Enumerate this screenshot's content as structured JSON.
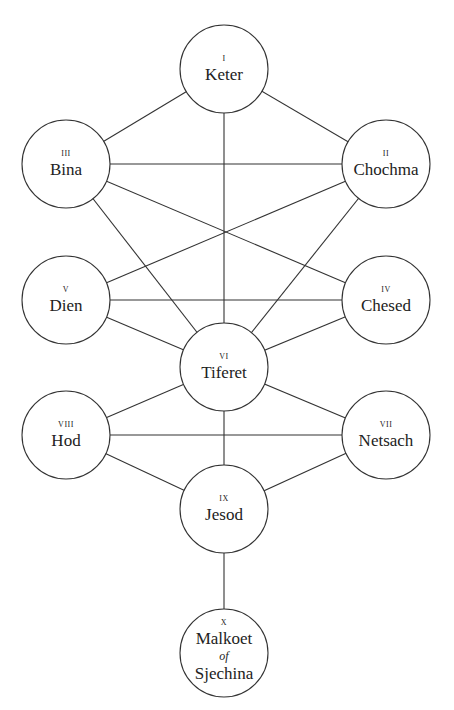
{
  "diagram": {
    "colors": {
      "line": "#333333",
      "fill": "#ffffff",
      "text": "#222222"
    },
    "radius": 44,
    "nodes": [
      {
        "id": "keter",
        "numeral": "I",
        "name": "Keter",
        "cx": 224,
        "cy": 69
      },
      {
        "id": "chochma",
        "numeral": "II",
        "name": "Chochma",
        "cx": 386,
        "cy": 164
      },
      {
        "id": "bina",
        "numeral": "III",
        "name": "Bina",
        "cx": 66,
        "cy": 164
      },
      {
        "id": "chesed",
        "numeral": "IV",
        "name": "Chesed",
        "cx": 386,
        "cy": 300
      },
      {
        "id": "dien",
        "numeral": "V",
        "name": "Dien",
        "cx": 66,
        "cy": 300
      },
      {
        "id": "tiferet",
        "numeral": "VI",
        "name": "Tiferet",
        "cx": 224,
        "cy": 367
      },
      {
        "id": "netsach",
        "numeral": "VII",
        "name": "Netsach",
        "cx": 386,
        "cy": 435
      },
      {
        "id": "hod",
        "numeral": "VIII",
        "name": "Hod",
        "cx": 66,
        "cy": 435
      },
      {
        "id": "jesod",
        "numeral": "IX",
        "name": "Jesod",
        "cx": 224,
        "cy": 509
      },
      {
        "id": "malkoet",
        "numeral": "X",
        "name": "Malkoet",
        "conj": "of",
        "name2": "Sjechina",
        "cx": 224,
        "cy": 653
      }
    ],
    "edges": [
      [
        "keter",
        "bina"
      ],
      [
        "keter",
        "chochma"
      ],
      [
        "keter",
        "tiferet"
      ],
      [
        "bina",
        "chochma"
      ],
      [
        "bina",
        "chesed"
      ],
      [
        "chochma",
        "dien"
      ],
      [
        "bina",
        "tiferet"
      ],
      [
        "chochma",
        "tiferet"
      ],
      [
        "dien",
        "chesed"
      ],
      [
        "dien",
        "tiferet"
      ],
      [
        "chesed",
        "tiferet"
      ],
      [
        "tiferet",
        "hod"
      ],
      [
        "tiferet",
        "netsach"
      ],
      [
        "tiferet",
        "jesod"
      ],
      [
        "hod",
        "netsach"
      ],
      [
        "hod",
        "jesod"
      ],
      [
        "netsach",
        "jesod"
      ],
      [
        "jesod",
        "malkoet"
      ]
    ]
  }
}
